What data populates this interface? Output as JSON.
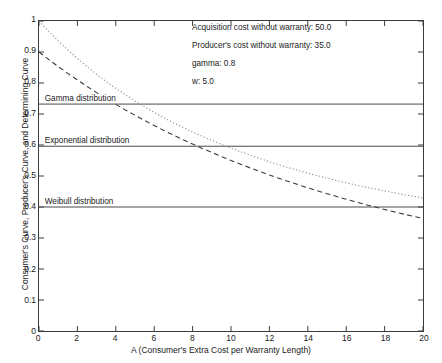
{
  "chart_data": {
    "type": "line",
    "title": "",
    "xlabel": "A (Consumer's Extra Cost per Warranty Length)",
    "ylabel": "Consumer's Curve, Producer's Curve, and Determining Curve",
    "xlim": [
      0,
      20
    ],
    "ylim": [
      0,
      1
    ],
    "xticks": [
      0,
      2,
      4,
      6,
      8,
      10,
      12,
      14,
      16,
      18,
      20
    ],
    "yticks": [
      0,
      0.1,
      0.2,
      0.3,
      0.4,
      0.5,
      0.6,
      0.7,
      0.8,
      0.9,
      1
    ],
    "ytick_labels": [
      "0",
      "0.1",
      "0.2",
      "0.3",
      "0.4",
      "0.5",
      "0.6",
      "0.7",
      "0.8",
      "0.9",
      "1"
    ],
    "xtick_labels": [
      "0",
      "2",
      "4",
      "6",
      "8",
      "10",
      "12",
      "14",
      "16",
      "18",
      "20"
    ],
    "grid": false,
    "legend_position": "none",
    "series": [
      {
        "name": "Consumer's Curve (dotted)",
        "style": "dotted",
        "color": "#8c8c8c",
        "x": [
          0,
          0.5,
          1,
          1.5,
          2,
          2.5,
          3,
          3.5,
          4,
          4.5,
          5,
          5.5,
          6,
          6.5,
          7,
          7.5,
          8,
          8.5,
          9,
          9.5,
          10,
          11,
          12,
          13,
          14,
          15,
          16,
          17,
          18,
          19,
          20
        ],
        "y": [
          1.0,
          0.967,
          0.936,
          0.907,
          0.879,
          0.853,
          0.828,
          0.805,
          0.783,
          0.762,
          0.742,
          0.723,
          0.705,
          0.688,
          0.672,
          0.657,
          0.642,
          0.628,
          0.615,
          0.602,
          0.59,
          0.567,
          0.546,
          0.527,
          0.509,
          0.493,
          0.478,
          0.464,
          0.452,
          0.44,
          0.429
        ]
      },
      {
        "name": "Producer's Curve (dashed)",
        "style": "dashed",
        "color": "#3a3a3a",
        "x": [
          0,
          0.5,
          1,
          1.5,
          2,
          2.5,
          3,
          3.5,
          4,
          4.5,
          5,
          5.5,
          6,
          6.5,
          7,
          7.5,
          8,
          8.5,
          9,
          9.5,
          10,
          11,
          12,
          13,
          14,
          15,
          16,
          17,
          18,
          19,
          20
        ],
        "y": [
          0.9,
          0.876,
          0.853,
          0.831,
          0.81,
          0.789,
          0.769,
          0.75,
          0.731,
          0.713,
          0.696,
          0.679,
          0.663,
          0.647,
          0.632,
          0.617,
          0.603,
          0.589,
          0.576,
          0.563,
          0.55,
          0.526,
          0.503,
          0.482,
          0.462,
          0.443,
          0.425,
          0.408,
          0.392,
          0.377,
          0.363
        ]
      }
    ],
    "reference_lines": [
      {
        "label": "Gamma distribution",
        "value": 0.732,
        "label_x": 0.35
      },
      {
        "label": "Exponential distribution",
        "value": 0.596,
        "label_x": 0.35
      },
      {
        "label": "Weibull distribution",
        "value": 0.4,
        "label_x": 0.35
      }
    ],
    "annotations": [
      "Acquisition cost without warranty: 50.0",
      "Producer's cost without warranty: 35.0",
      "gamma: 0.8",
      "w: 5.0"
    ]
  }
}
